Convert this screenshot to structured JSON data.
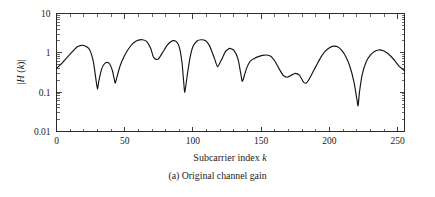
{
  "figure": {
    "caption": "(a) Original channel gain"
  },
  "chart_data": {
    "type": "line",
    "title": "",
    "xlabel": "Subcarrier index k",
    "ylabel": "|H (k)|",
    "xlim": [
      0,
      255
    ],
    "ylim": [
      0.01,
      10
    ],
    "yscale": "log",
    "xscale": "linear",
    "grid": false,
    "legend": null,
    "xticks": [
      0,
      50,
      100,
      150,
      200,
      250
    ],
    "xtick_labels": [
      "0",
      "50",
      "100",
      "150",
      "200",
      "250"
    ],
    "xminor_step": 10,
    "yticks": [
      0.01,
      0.1,
      1,
      10
    ],
    "ytick_labels": [
      "0.01",
      "0.1",
      "1",
      "10"
    ],
    "series": [
      {
        "name": "Original channel gain",
        "x": [
          0,
          3,
          6,
          9,
          12,
          15,
          18,
          21,
          24,
          27,
          29,
          30,
          31,
          33,
          35,
          37,
          39,
          41,
          42,
          43,
          44,
          46,
          48,
          51,
          54,
          57,
          60,
          63,
          66,
          69,
          71,
          73,
          75,
          78,
          81,
          84,
          86,
          88,
          90,
          92,
          93,
          94,
          96,
          98,
          100,
          103,
          106,
          109,
          112,
          114,
          116,
          118,
          121,
          124,
          127,
          130,
          133,
          135,
          136,
          137,
          139,
          142,
          145,
          148,
          151,
          154,
          157,
          160,
          163,
          166,
          169,
          172,
          175,
          178,
          181,
          183,
          185,
          188,
          191,
          194,
          197,
          200,
          203,
          206,
          209,
          212,
          215,
          218,
          220,
          221,
          222,
          224,
          227,
          230,
          233,
          236,
          239,
          242,
          245,
          248,
          251,
          255
        ],
        "y": [
          0.4,
          0.5,
          0.65,
          0.85,
          1.1,
          1.4,
          1.55,
          1.5,
          1.25,
          0.6,
          0.2,
          0.12,
          0.19,
          0.38,
          0.52,
          0.57,
          0.52,
          0.35,
          0.24,
          0.17,
          0.22,
          0.4,
          0.62,
          1.0,
          1.45,
          1.85,
          2.1,
          2.15,
          1.95,
          1.3,
          0.78,
          0.68,
          0.72,
          1.05,
          1.55,
          1.95,
          2.05,
          1.9,
          1.4,
          0.55,
          0.22,
          0.1,
          0.3,
          0.8,
          1.45,
          2.0,
          2.15,
          2.05,
          1.55,
          1.05,
          0.68,
          0.44,
          0.68,
          1.1,
          1.3,
          1.15,
          0.7,
          0.3,
          0.19,
          0.22,
          0.38,
          0.62,
          0.72,
          0.8,
          0.86,
          0.88,
          0.82,
          0.62,
          0.4,
          0.27,
          0.24,
          0.27,
          0.3,
          0.27,
          0.18,
          0.17,
          0.21,
          0.33,
          0.52,
          0.8,
          1.1,
          1.35,
          1.48,
          1.42,
          1.15,
          0.8,
          0.45,
          0.18,
          0.07,
          0.045,
          0.1,
          0.28,
          0.6,
          0.88,
          1.08,
          1.18,
          1.15,
          1.0,
          0.82,
          0.62,
          0.46,
          0.35
        ]
      }
    ]
  }
}
